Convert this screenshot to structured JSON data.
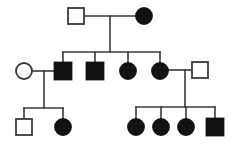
{
  "figure": {
    "background_color": "#ffffff",
    "line_color": "#3a3a3a",
    "affected_fill_color": "#121212",
    "unaffected_fill_color": "#ffffff",
    "width": 249,
    "height": 144
  },
  "legend": {
    "square_meaning": "male",
    "circle_meaning": "female",
    "filled_meaning": "affected",
    "open_meaning": "unaffected"
  },
  "chart_data": {
    "type": "diagram",
    "generations": 3,
    "individuals": [
      {
        "id": "I-1",
        "generation": 1,
        "sex": "male",
        "shape": "square",
        "affected": false,
        "cx": 76,
        "cy": 16,
        "size": 16
      },
      {
        "id": "I-2",
        "generation": 1,
        "sex": "female",
        "shape": "circle",
        "affected": true,
        "cx": 144,
        "cy": 16,
        "size": 16
      },
      {
        "id": "II-1",
        "generation": 2,
        "sex": "female",
        "shape": "circle",
        "affected": false,
        "cx": 24,
        "cy": 71,
        "size": 16
      },
      {
        "id": "II-2",
        "generation": 2,
        "sex": "male",
        "shape": "square",
        "affected": true,
        "cx": 63,
        "cy": 71,
        "size": 17
      },
      {
        "id": "II-3",
        "generation": 2,
        "sex": "male",
        "shape": "square",
        "affected": true,
        "cx": 95,
        "cy": 71,
        "size": 17
      },
      {
        "id": "II-4",
        "generation": 2,
        "sex": "female",
        "shape": "circle",
        "affected": true,
        "cx": 128,
        "cy": 71,
        "size": 16
      },
      {
        "id": "II-5",
        "generation": 2,
        "sex": "female",
        "shape": "circle",
        "affected": true,
        "cx": 160,
        "cy": 71,
        "size": 16
      },
      {
        "id": "II-6",
        "generation": 2,
        "sex": "male",
        "shape": "square",
        "affected": false,
        "cx": 200,
        "cy": 70,
        "size": 16
      },
      {
        "id": "III-1",
        "generation": 3,
        "sex": "male",
        "shape": "square",
        "affected": false,
        "cx": 24,
        "cy": 127,
        "size": 16
      },
      {
        "id": "III-2",
        "generation": 3,
        "sex": "female",
        "shape": "circle",
        "affected": true,
        "cx": 63,
        "cy": 127,
        "size": 16
      },
      {
        "id": "III-3",
        "generation": 3,
        "sex": "female",
        "shape": "circle",
        "affected": true,
        "cx": 136,
        "cy": 127,
        "size": 16
      },
      {
        "id": "III-4",
        "generation": 3,
        "sex": "female",
        "shape": "circle",
        "affected": true,
        "cx": 161,
        "cy": 127,
        "size": 16
      },
      {
        "id": "III-5",
        "generation": 3,
        "sex": "female",
        "shape": "circle",
        "affected": true,
        "cx": 186,
        "cy": 127,
        "size": 16
      },
      {
        "id": "III-6",
        "generation": 3,
        "sex": "male",
        "shape": "square",
        "affected": true,
        "cx": 215,
        "cy": 127,
        "size": 17
      }
    ],
    "matings": [
      {
        "id": "M1",
        "partners": [
          "I-1",
          "I-2"
        ],
        "children": [
          "II-2",
          "II-3",
          "II-4",
          "II-5"
        ]
      },
      {
        "id": "M2",
        "partners": [
          "II-1",
          "II-2"
        ],
        "children": [
          "III-1",
          "III-2"
        ]
      },
      {
        "id": "M3",
        "partners": [
          "II-5",
          "II-6"
        ],
        "children": [
          "III-3",
          "III-4",
          "III-5",
          "III-6"
        ]
      }
    ],
    "counts": {
      "total_individuals": 14,
      "affected_individuals": 10,
      "unaffected_individuals": 4,
      "males": 7,
      "females": 7
    }
  }
}
